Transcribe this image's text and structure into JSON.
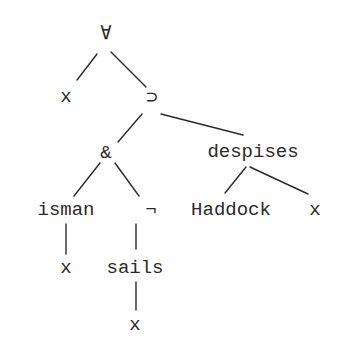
{
  "diagram": {
    "type": "logic-parse-tree",
    "nodes": [
      {
        "id": "forall",
        "label": "∀",
        "x": 106,
        "y": 34
      },
      {
        "id": "x1",
        "label": "x",
        "x": 66,
        "y": 97
      },
      {
        "id": "implies",
        "label": "⊃",
        "x": 152,
        "y": 98
      },
      {
        "id": "and",
        "label": "&",
        "x": 106,
        "y": 153
      },
      {
        "id": "despises",
        "label": "despises",
        "x": 253,
        "y": 152
      },
      {
        "id": "isman",
        "label": "isman",
        "x": 66,
        "y": 210
      },
      {
        "id": "not",
        "label": "¬",
        "x": 151,
        "y": 210
      },
      {
        "id": "haddock",
        "label": "Haddock",
        "x": 231,
        "y": 210
      },
      {
        "id": "x2",
        "label": "x",
        "x": 315,
        "y": 210
      },
      {
        "id": "x3",
        "label": "x",
        "x": 66,
        "y": 268
      },
      {
        "id": "sails",
        "label": "sails",
        "x": 135,
        "y": 268
      },
      {
        "id": "x4",
        "label": "x",
        "x": 135,
        "y": 325
      }
    ],
    "edges": [
      {
        "from": "forall",
        "to": "x1",
        "x1": 97,
        "y1": 54,
        "x2": 77,
        "y2": 80
      },
      {
        "from": "forall",
        "to": "implies",
        "x1": 111,
        "y1": 52,
        "x2": 146,
        "y2": 87
      },
      {
        "from": "implies",
        "to": "and",
        "x1": 142,
        "y1": 114,
        "x2": 118,
        "y2": 142
      },
      {
        "from": "implies",
        "to": "despises",
        "x1": 161,
        "y1": 114,
        "x2": 243,
        "y2": 135
      },
      {
        "from": "and",
        "to": "isman",
        "x1": 100,
        "y1": 163,
        "x2": 74,
        "y2": 196
      },
      {
        "from": "and",
        "to": "not",
        "x1": 115,
        "y1": 163,
        "x2": 139,
        "y2": 196
      },
      {
        "from": "despises",
        "to": "haddock",
        "x1": 246,
        "y1": 167,
        "x2": 225,
        "y2": 193
      },
      {
        "from": "despises",
        "to": "x2",
        "x1": 250,
        "y1": 167,
        "x2": 308,
        "y2": 194
      },
      {
        "from": "isman",
        "to": "x3",
        "x1": 66,
        "y1": 224,
        "x2": 66,
        "y2": 254
      },
      {
        "from": "not",
        "to": "sails",
        "x1": 136,
        "y1": 224,
        "x2": 136,
        "y2": 249
      },
      {
        "from": "sails",
        "to": "x4",
        "x1": 136,
        "y1": 282,
        "x2": 136,
        "y2": 310
      }
    ]
  }
}
